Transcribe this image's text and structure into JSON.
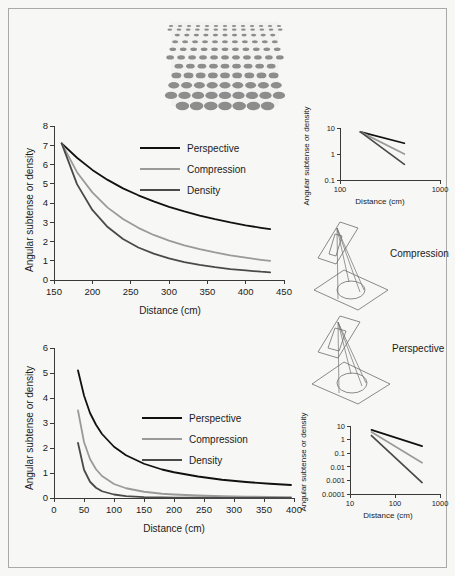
{
  "figure": {
    "background_color": "#f7f7f5",
    "border_color": "#a9a9a9",
    "series_colors": {
      "perspective": "#111111",
      "compression": "#9a9a9a",
      "density": "#4a4a4a"
    }
  },
  "texture_patch": {
    "name": "texture-gradient-patch",
    "element_color": "#8d8d8d",
    "background_color": "#f2f2f0",
    "rows": 11,
    "columns": 11,
    "description": "Texture gradient of gray ellipses, smaller and denser toward the top"
  },
  "chart_data": [
    {
      "id": "top-linear-chart",
      "type": "line",
      "title": "",
      "xlabel": "Distance (cm)",
      "ylabel": "Angular subtense or density",
      "xlim": [
        150,
        450
      ],
      "ylim": [
        0,
        8
      ],
      "xticks": [
        150,
        200,
        250,
        300,
        350,
        400,
        450
      ],
      "yticks": [
        0,
        1,
        2,
        3,
        4,
        5,
        6,
        7,
        8
      ],
      "grid": false,
      "legend_position": "upper-center",
      "x": [
        160,
        180,
        200,
        220,
        240,
        260,
        280,
        300,
        320,
        340,
        360,
        380,
        400,
        420,
        432
      ],
      "series": [
        {
          "name": "Perspective",
          "color": "#111111",
          "values": [
            7.1,
            6.35,
            5.72,
            5.2,
            4.76,
            4.4,
            4.08,
            3.8,
            3.56,
            3.35,
            3.16,
            2.99,
            2.84,
            2.71,
            2.64
          ]
        },
        {
          "name": "Compression",
          "color": "#9a9a9a",
          "values": [
            7.1,
            5.6,
            4.55,
            3.76,
            3.17,
            2.71,
            2.34,
            2.05,
            1.8,
            1.6,
            1.43,
            1.28,
            1.16,
            1.05,
            0.99
          ]
        },
        {
          "name": "Density",
          "color": "#4a4a4a",
          "values": [
            7.1,
            4.98,
            3.64,
            2.75,
            2.13,
            1.69,
            1.37,
            1.12,
            0.93,
            0.79,
            0.67,
            0.57,
            0.5,
            0.43,
            0.4
          ]
        }
      ]
    },
    {
      "id": "top-loglog-inset",
      "type": "line",
      "title": "",
      "xlabel": "Distance (cm)",
      "ylabel": "Angular subtense or density",
      "xscale": "log",
      "yscale": "log",
      "xlim": [
        100,
        1000
      ],
      "ylim": [
        0.1,
        10
      ],
      "xticks": [
        100,
        1000
      ],
      "xticklabels": [
        "100",
        "1000"
      ],
      "yticks": [
        0.1,
        1,
        10
      ],
      "yticklabels": [
        "0.1",
        "1",
        "10"
      ],
      "grid": false,
      "x": [
        160,
        440
      ],
      "series": [
        {
          "name": "Perspective",
          "color": "#111111",
          "values": [
            7.1,
            2.6
          ]
        },
        {
          "name": "Compression",
          "color": "#9a9a9a",
          "values": [
            7.1,
            1.0
          ]
        },
        {
          "name": "Density",
          "color": "#4a4a4a",
          "values": [
            7.1,
            0.4
          ]
        }
      ]
    },
    {
      "id": "bottom-linear-chart",
      "type": "line",
      "title": "",
      "xlabel": "Distance (cm)",
      "ylabel": "Angular subtense or density",
      "xlim": [
        0,
        400
      ],
      "ylim": [
        0,
        6
      ],
      "xticks": [
        0,
        50,
        100,
        150,
        200,
        250,
        300,
        350,
        400
      ],
      "yticks": [
        0,
        1,
        2,
        3,
        4,
        5,
        6
      ],
      "grid": false,
      "legend_position": "center-right",
      "x": [
        40,
        50,
        60,
        70,
        80,
        100,
        120,
        150,
        180,
        200,
        240,
        280,
        320,
        360,
        395
      ],
      "series": [
        {
          "name": "Perspective",
          "color": "#111111",
          "values": [
            5.1,
            4.1,
            3.4,
            2.93,
            2.56,
            2.05,
            1.71,
            1.37,
            1.14,
            1.03,
            0.86,
            0.73,
            0.64,
            0.57,
            0.52
          ]
        },
        {
          "name": "Compression",
          "color": "#9a9a9a",
          "values": [
            3.5,
            2.24,
            1.56,
            1.15,
            0.88,
            0.56,
            0.39,
            0.25,
            0.17,
            0.14,
            0.1,
            0.07,
            0.055,
            0.043,
            0.036
          ]
        },
        {
          "name": "Density",
          "color": "#4a4a4a",
          "values": [
            2.2,
            1.13,
            0.65,
            0.41,
            0.27,
            0.14,
            0.076,
            0.039,
            0.023,
            0.017,
            0.01,
            0.006,
            0.004,
            0.003,
            0.0024
          ]
        }
      ]
    },
    {
      "id": "bottom-loglog-inset",
      "type": "line",
      "title": "",
      "xlabel": "Distance (cm)",
      "ylabel": "Angular subtense or density",
      "xscale": "log",
      "yscale": "log",
      "xlim": [
        10,
        1000
      ],
      "ylim": [
        0.0001,
        10
      ],
      "xticks": [
        10,
        100,
        1000
      ],
      "xticklabels": [
        "10",
        "100",
        "1000"
      ],
      "yticks": [
        0.0001,
        0.001,
        0.01,
        0.1,
        1,
        10
      ],
      "yticklabels": [
        "0.0001",
        "0.001",
        "0.01",
        "0.1",
        "1",
        "10"
      ],
      "grid": false,
      "x": [
        30,
        400
      ],
      "series": [
        {
          "name": "Perspective",
          "color": "#111111",
          "values": [
            5.2,
            0.33
          ]
        },
        {
          "name": "Compression",
          "color": "#9a9a9a",
          "values": [
            3.6,
            0.02
          ]
        },
        {
          "name": "Density",
          "color": "#4a4a4a",
          "values": [
            2.0,
            0.0007
          ]
        }
      ]
    }
  ],
  "legends": {
    "top": [
      {
        "label": "Perspective",
        "color": "#111111"
      },
      {
        "label": "Compression",
        "color": "#9a9a9a"
      },
      {
        "label": "Density",
        "color": "#4a4a4a"
      }
    ],
    "bottom": [
      {
        "label": "Perspective",
        "color": "#111111"
      },
      {
        "label": "Compression",
        "color": "#9a9a9a"
      },
      {
        "label": "Density",
        "color": "#4a4a4a"
      }
    ]
  },
  "diagrams": [
    {
      "id": "compression-diagram",
      "label": "Compression",
      "description": "Projection of a ground-plane circle onto a vertical picture plane"
    },
    {
      "id": "perspective-diagram",
      "label": "Perspective",
      "description": "Projection of a ground-plane circle onto a vertical picture plane"
    }
  ],
  "axis_titles": {
    "distance": "Distance (cm)",
    "angular": "Angular subtense or density"
  }
}
